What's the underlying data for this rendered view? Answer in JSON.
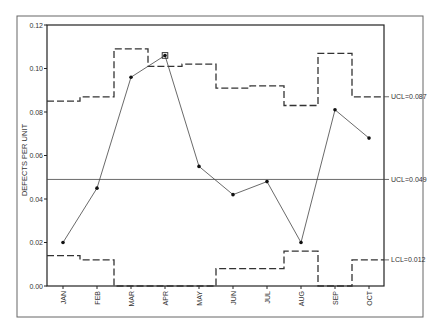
{
  "chart_data": {
    "type": "line",
    "title": "",
    "xlabel": "",
    "ylabel": "DEFECTS PER UNIT",
    "ylim": [
      0,
      0.12
    ],
    "yticks": [
      "0.00",
      "0.02",
      "0.04",
      "0.06",
      "0.08",
      "0.10",
      "0.12"
    ],
    "categories": [
      "JAN",
      "FEB",
      "MAR",
      "APR",
      "MAY",
      "JUN",
      "JUL",
      "AUG",
      "SEP",
      "OCT"
    ],
    "grid": false,
    "legend": null,
    "series": [
      {
        "name": "Defects per unit",
        "style": "solid-line-markers",
        "values": [
          0.02,
          0.045,
          0.096,
          0.106,
          0.055,
          0.042,
          0.048,
          0.02,
          0.081,
          0.068
        ],
        "highlighted_point": "APR"
      },
      {
        "name": "UCL (variable)",
        "style": "dashed-step",
        "values": [
          0.085,
          0.087,
          0.109,
          0.101,
          0.102,
          0.091,
          0.092,
          0.083,
          0.107,
          0.087
        ]
      },
      {
        "name": "Center line",
        "style": "solid",
        "value": 0.049
      },
      {
        "name": "LCL (variable)",
        "style": "dashed-step",
        "values": [
          0.014,
          0.012,
          0,
          0,
          0,
          0.008,
          0.008,
          0.016,
          0,
          0.012
        ]
      }
    ],
    "annotations": [
      {
        "text": "UCL=0.087",
        "y": 0.087
      },
      {
        "text": "UCL=0.049",
        "y": 0.049
      },
      {
        "text": "LCL=0.012",
        "y": 0.012
      }
    ]
  },
  "colors": {
    "line": "#333333",
    "marker": "#111111",
    "frame": "#555555",
    "background": "#ffffff"
  }
}
